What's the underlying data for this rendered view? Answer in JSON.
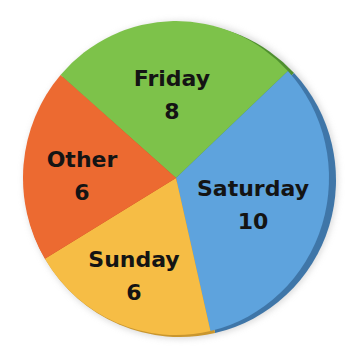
{
  "chart_data": {
    "type": "pie",
    "title": "",
    "categories": [
      "Friday",
      "Saturday",
      "Sunday",
      "Other"
    ],
    "values": [
      8,
      10,
      6,
      6
    ],
    "colors": [
      "#7dc24a",
      "#5ea3dd",
      "#f6bd45",
      "#ec6a31"
    ],
    "rim_colors": [
      "#4f8f2f",
      "#3f76a8",
      "#c9962e",
      "#c04f22"
    ],
    "start_angle_deg": 311,
    "direction": "clockwise",
    "legend": "none",
    "labels_inside": true
  },
  "labels": [
    {
      "name": "Friday",
      "value": "8"
    },
    {
      "name": "Saturday",
      "value": "10"
    },
    {
      "name": "Sunday",
      "value": "6"
    },
    {
      "name": "Other",
      "value": "6"
    }
  ]
}
